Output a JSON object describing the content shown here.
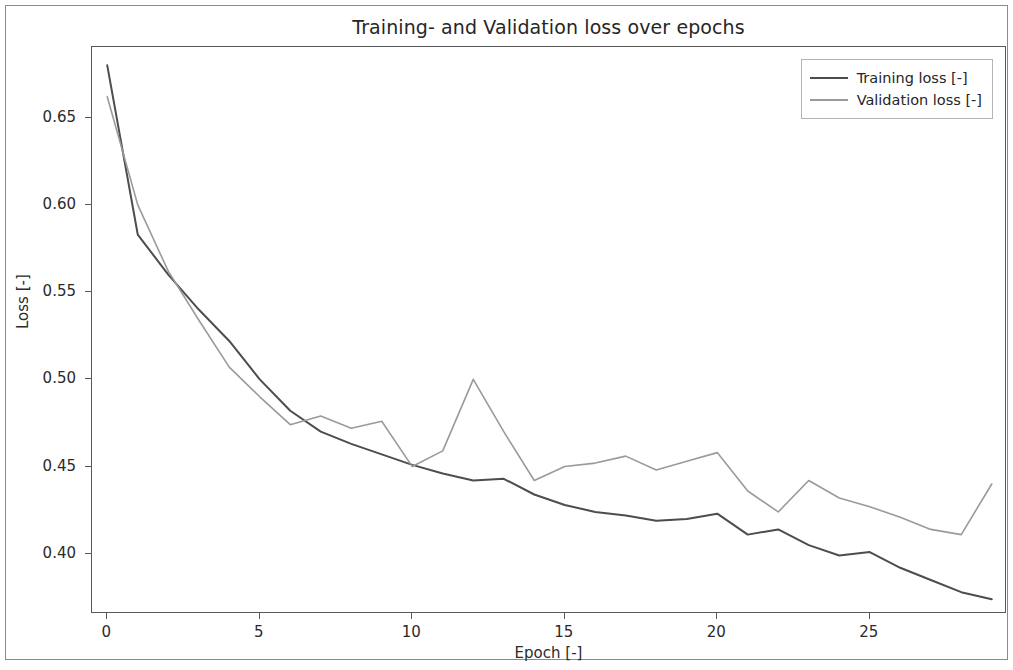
{
  "chart_data": {
    "type": "line",
    "title": "Training- and Validation loss over epochs",
    "xlabel": "Epoch [-]",
    "ylabel": "Loss [-]",
    "grid": false,
    "legend_position": "upper right",
    "xlim": [
      -0.5,
      29.5
    ],
    "ylim": [
      0.3655,
      0.6905
    ],
    "xticks": [
      0,
      5,
      10,
      15,
      20,
      25
    ],
    "xtick_labels": [
      "0",
      "5",
      "10",
      "15",
      "20",
      "25"
    ],
    "yticks": [
      0.4,
      0.45,
      0.5,
      0.55,
      0.6,
      0.65
    ],
    "ytick_labels": [
      "0.40",
      "0.45",
      "0.50",
      "0.55",
      "0.60",
      "0.65"
    ],
    "x": [
      0,
      1,
      2,
      3,
      4,
      5,
      6,
      7,
      8,
      9,
      10,
      11,
      12,
      13,
      14,
      15,
      16,
      17,
      18,
      19,
      20,
      21,
      22,
      23,
      24,
      25,
      26,
      27,
      28,
      29
    ],
    "series": [
      {
        "name": "Training loss [-]",
        "color": "#4d4d4d",
        "linewidth": 2.0,
        "values": [
          0.68,
          0.583,
          0.56,
          0.54,
          0.522,
          0.5,
          0.482,
          0.47,
          0.463,
          0.457,
          0.451,
          0.446,
          0.442,
          0.443,
          0.434,
          0.428,
          0.424,
          0.422,
          0.419,
          0.42,
          0.423,
          0.411,
          0.414,
          0.405,
          0.399,
          0.401,
          0.392,
          0.385,
          0.378,
          0.374
        ]
      },
      {
        "name": "Validation loss [-]",
        "color": "#9a9a9a",
        "linewidth": 1.6,
        "values": [
          0.662,
          0.6,
          0.562,
          0.534,
          0.507,
          0.49,
          0.474,
          0.479,
          0.472,
          0.476,
          0.45,
          0.459,
          0.5,
          0.47,
          0.442,
          0.45,
          0.452,
          0.456,
          0.448,
          0.453,
          0.458,
          0.436,
          0.424,
          0.442,
          0.432,
          0.427,
          0.421,
          0.414,
          0.411,
          0.44
        ]
      }
    ]
  },
  "legend": {
    "entries": [
      {
        "label": "Training loss [-]"
      },
      {
        "label": "Validation loss [-]"
      }
    ]
  }
}
